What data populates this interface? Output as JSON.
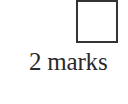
{
  "question": {
    "answer_box": {
      "value": ""
    },
    "marks_label": "2 marks"
  }
}
